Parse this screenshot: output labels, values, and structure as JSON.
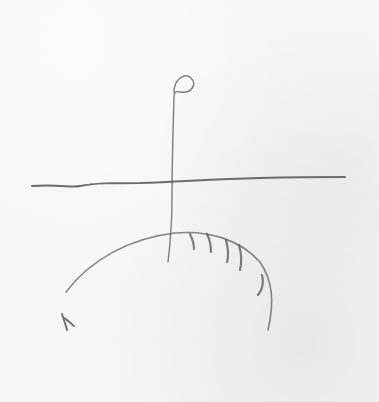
{
  "image": {
    "description": "Pencil sketch on white paper: a horizontal line crossed by a vertical stem topped with a small loop, a large arc with short hatch marks below, and a small scribbled mark at lower left.",
    "colors": {
      "paper": "#f6f6f6",
      "pencil": "#555555"
    },
    "elements": [
      {
        "name": "horizon-line",
        "label": "horizontal pencil line"
      },
      {
        "name": "stem-with-loop",
        "label": "vertical stem with loop at top"
      },
      {
        "name": "hatched-arc",
        "label": "arc with hatch marks"
      },
      {
        "name": "small-mark",
        "label": "small scribble mark"
      }
    ]
  }
}
